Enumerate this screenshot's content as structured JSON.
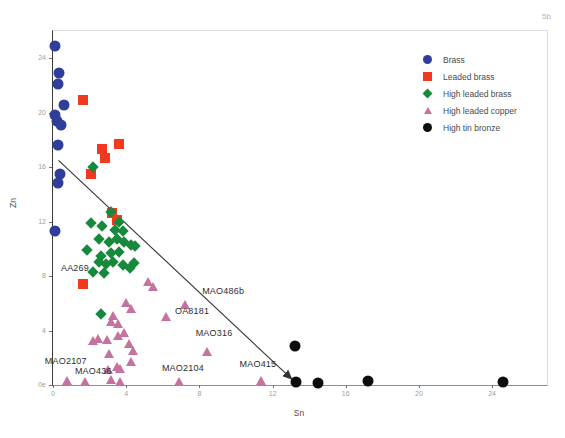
{
  "figure_label": "5b",
  "chart_data": {
    "type": "scatter",
    "title": "",
    "xlabel": "Sn",
    "ylabel": "Zn",
    "xlim": [
      0,
      27
    ],
    "ylim": [
      0,
      26
    ],
    "grid": false,
    "legend_position": "top-right-inside",
    "x_ticks": [
      {
        "value": 0,
        "label": "0"
      },
      {
        "value": 4,
        "label": "4"
      },
      {
        "value": 8,
        "label": "8"
      },
      {
        "value": 12,
        "label": "12"
      },
      {
        "value": 16,
        "label": "16"
      },
      {
        "value": 20,
        "label": "20"
      },
      {
        "value": 24,
        "label": "24"
      }
    ],
    "y_ticks": [
      {
        "value": 24,
        "label": "24"
      },
      {
        "value": 20,
        "label": "20"
      },
      {
        "value": 16,
        "label": "16"
      },
      {
        "value": 12,
        "label": "12"
      },
      {
        "value": 8,
        "label": "8"
      },
      {
        "value": 4,
        "label": "4"
      },
      {
        "value": 0,
        "label": "0e"
      }
    ],
    "series": [
      {
        "name": "Brass",
        "marker": "circle",
        "color": "#2f3e9a",
        "points": [
          [
            0.1,
            24.9
          ],
          [
            0.35,
            22.9
          ],
          [
            0.3,
            22.1
          ],
          [
            0.6,
            20.6
          ],
          [
            0.1,
            19.8
          ],
          [
            0.2,
            19.4
          ],
          [
            0.45,
            19.1
          ],
          [
            0.25,
            17.6
          ],
          [
            0.4,
            15.5
          ],
          [
            0.3,
            14.8
          ],
          [
            0.1,
            11.3
          ]
        ]
      },
      {
        "name": "Leaded brass",
        "marker": "square",
        "color": "#f1391d",
        "points": [
          [
            1.65,
            20.9
          ],
          [
            3.6,
            17.7
          ],
          [
            2.7,
            17.3
          ],
          [
            2.85,
            16.7
          ],
          [
            2.1,
            15.5
          ],
          [
            3.25,
            12.6
          ],
          [
            3.5,
            12.1
          ],
          [
            1.65,
            7.4
          ]
        ]
      },
      {
        "name": "High leaded brass",
        "marker": "diamond",
        "color": "#17893c",
        "points": [
          [
            2.2,
            16.0
          ],
          [
            3.15,
            12.7
          ],
          [
            3.6,
            12.0
          ],
          [
            2.1,
            11.9
          ],
          [
            2.7,
            11.7
          ],
          [
            3.4,
            11.4
          ],
          [
            3.8,
            11.3
          ],
          [
            2.5,
            10.7
          ],
          [
            3.05,
            10.5
          ],
          [
            3.5,
            10.7
          ],
          [
            3.9,
            10.5
          ],
          [
            4.25,
            10.3
          ],
          [
            4.5,
            10.2
          ],
          [
            1.85,
            9.9
          ],
          [
            2.6,
            9.5
          ],
          [
            3.15,
            9.7
          ],
          [
            3.6,
            9.8
          ],
          [
            2.5,
            9.0
          ],
          [
            2.9,
            8.9
          ],
          [
            3.3,
            9.05
          ],
          [
            3.8,
            8.8
          ],
          [
            4.2,
            8.6
          ],
          [
            4.45,
            8.95
          ],
          [
            2.2,
            8.3
          ],
          [
            2.8,
            8.2
          ],
          [
            2.6,
            5.2
          ]
        ]
      },
      {
        "name": "High leaded copper",
        "marker": "triangle",
        "color": "#c4729f",
        "points": [
          [
            5.2,
            7.6
          ],
          [
            5.5,
            7.2
          ],
          [
            7.25,
            5.9
          ],
          [
            4.0,
            6.0
          ],
          [
            4.3,
            5.6
          ],
          [
            3.3,
            5.1
          ],
          [
            6.2,
            5.0
          ],
          [
            3.2,
            4.6
          ],
          [
            3.6,
            4.5
          ],
          [
            3.9,
            3.8
          ],
          [
            3.6,
            3.6
          ],
          [
            3.0,
            3.3
          ],
          [
            2.5,
            3.4
          ],
          [
            2.2,
            3.2
          ],
          [
            4.2,
            3.0
          ],
          [
            4.4,
            2.5
          ],
          [
            3.1,
            2.3
          ],
          [
            8.45,
            2.4
          ],
          [
            4.3,
            1.7
          ],
          [
            3.5,
            1.3
          ],
          [
            3.05,
            1.1
          ],
          [
            3.7,
            1.2
          ],
          [
            0.8,
            0.3
          ],
          [
            1.8,
            0.2
          ],
          [
            3.2,
            0.4
          ],
          [
            3.7,
            0.2
          ],
          [
            6.9,
            0.2
          ],
          [
            11.4,
            0.3
          ]
        ]
      },
      {
        "name": "High tin bronze",
        "marker": "circle",
        "color": "#0d0d0d",
        "points": [
          [
            13.2,
            2.9
          ],
          [
            13.3,
            0.25
          ],
          [
            14.5,
            0.15
          ],
          [
            17.2,
            0.3
          ],
          [
            24.6,
            0.2
          ]
        ]
      }
    ],
    "annotations": {
      "labels": [
        {
          "text": "AA269",
          "x": 1.2,
          "y": 8.6
        },
        {
          "text": "MAO486b",
          "x": 9.3,
          "y": 6.9
        },
        {
          "text": "OA8181",
          "x": 7.6,
          "y": 5.4
        },
        {
          "text": "MAO316",
          "x": 8.8,
          "y": 3.8
        },
        {
          "text": "MAO2107",
          "x": 0.7,
          "y": 1.75
        },
        {
          "text": "MAO436",
          "x": 2.2,
          "y": 1.0
        },
        {
          "text": "MAO2104",
          "x": 7.1,
          "y": 1.25
        },
        {
          "text": "MAO415",
          "x": 11.2,
          "y": 1.55
        }
      ],
      "arrow": {
        "x1": 0.3,
        "y1": 16.5,
        "x2": 13.0,
        "y2": 0.5,
        "color": "#333333"
      }
    }
  }
}
